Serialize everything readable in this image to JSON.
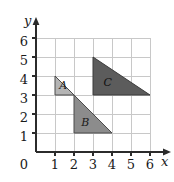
{
  "figure": {
    "title": "",
    "axes": {
      "x_axis_label": "x",
      "y_axis_label": "y",
      "x_ticks": [
        "1",
        "2",
        "3",
        "4",
        "5",
        "6"
      ],
      "y_ticks": [
        "1",
        "2",
        "3",
        "4",
        "5",
        "6"
      ],
      "origin_label": "0",
      "x_range": [
        0,
        6
      ],
      "y_range": [
        0,
        6
      ],
      "grid": true,
      "arrowheads": true
    },
    "shapes": [
      {
        "label": "A",
        "type": "right-triangle",
        "vertices": [
          [
            1,
            4
          ],
          [
            1,
            3
          ],
          [
            2,
            3
          ]
        ],
        "fill": "#b4b4b4",
        "stroke": "#4a4a4a",
        "label_pos": [
          1.22,
          3.45
        ]
      },
      {
        "label": "B",
        "type": "right-triangle",
        "vertices": [
          [
            2,
            3
          ],
          [
            2,
            1
          ],
          [
            4,
            1
          ]
        ],
        "fill": "#8c8c8c",
        "stroke": "#4a4a4a",
        "label_pos": [
          2.38,
          1.52
        ]
      },
      {
        "label": "C",
        "type": "right-triangle",
        "vertices": [
          [
            3,
            5
          ],
          [
            3,
            3
          ],
          [
            6,
            3
          ]
        ],
        "fill": "#5c5c5c",
        "stroke": "#3a3a3a",
        "label_pos": [
          3.55,
          3.62
        ]
      }
    ],
    "colors": {
      "background": "#ffffff",
      "grid_line": "#c8c8c8",
      "axis_line": "#2b2b2b",
      "text": "#1a1a1a"
    }
  }
}
